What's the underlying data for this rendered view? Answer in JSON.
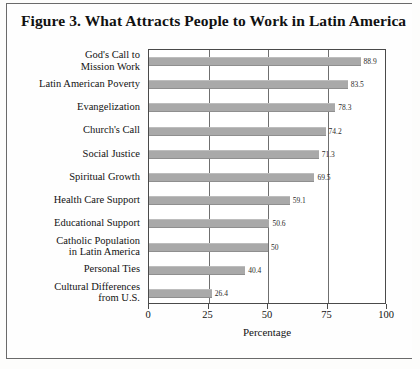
{
  "figure": {
    "title": "Figure 3.  What Attracts People to Work in Latin America"
  },
  "colors": {
    "bar_fill": "#a9a9a9",
    "axis": "#4a4a4a",
    "gridline": "#6f6f6f",
    "text": "#121212",
    "page_background": "#fdfdfc",
    "border": "#6a6a6a"
  },
  "chart_data": {
    "type": "bar",
    "orientation": "horizontal",
    "title": "Figure 3.  What Attracts People to Work in Latin America",
    "xlabel": "Percentage",
    "ylabel": "",
    "xlim": [
      0,
      100
    ],
    "xticks": [
      "0",
      "25",
      "50",
      "75",
      "100"
    ],
    "grid": true,
    "legend": "none",
    "categories": [
      "God's Call to\nMission Work",
      "Latin American Poverty",
      "Evangelization",
      "Church's Call",
      "Social Justice",
      "Spiritual Growth",
      "Health Care Support",
      "Educational Support",
      "Catholic Population\nin Latin America",
      "Personal Ties",
      "Cultural Differences\nfrom U.S."
    ],
    "values": [
      88.9,
      83.5,
      78.3,
      74.2,
      71.3,
      69.5,
      59.1,
      50.6,
      50,
      40.4,
      26.4
    ],
    "value_labels": [
      "88.9",
      "83.5",
      "78.3",
      "74.2",
      "71.3",
      "69.5",
      "59.1",
      "50.6",
      "50",
      "40.4",
      "26.4"
    ]
  }
}
